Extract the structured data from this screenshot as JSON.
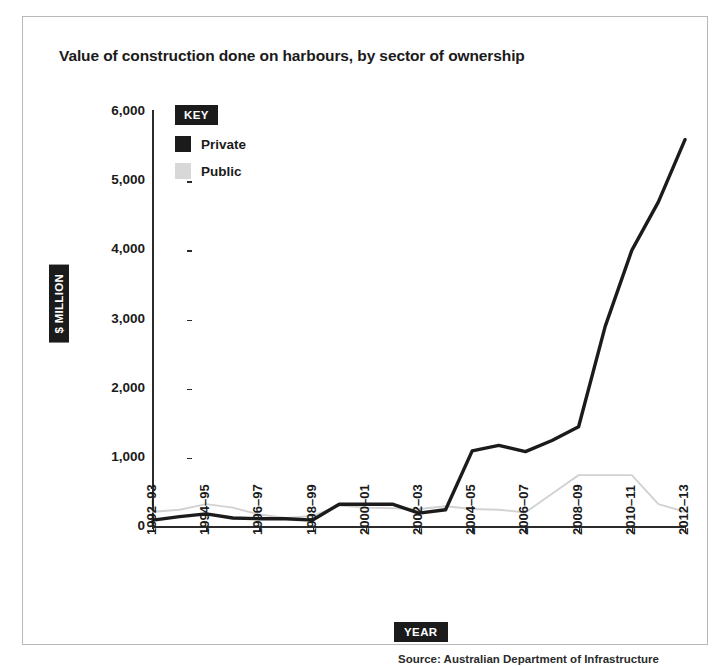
{
  "chart_data": {
    "type": "line",
    "title": "Value of construction done on harbours, by sector of ownership",
    "xlabel": "YEAR",
    "ylabel": "$ MILLION",
    "ylim": [
      0,
      6000
    ],
    "grid": false,
    "legend_position": "top-left",
    "legend_title": "KEY",
    "x": [
      "1992-93",
      "1993-94",
      "1994-95",
      "1995-96",
      "1996-97",
      "1997-98",
      "1998-99",
      "1999-00",
      "2000-01",
      "2001-02",
      "2002-03",
      "2003-04",
      "2004-05",
      "2005-06",
      "2006-07",
      "2007-08",
      "2008-09",
      "2009-10",
      "2010-11",
      "2011-12",
      "2012-13"
    ],
    "xtick_labels": [
      "1992–93",
      "1994–95",
      "1996–97",
      "1998–99",
      "2000–01",
      "2002–03",
      "2004–05",
      "2006–07",
      "2008–09",
      "2010–11",
      "2012–13"
    ],
    "ytick_labels": [
      "0",
      "1,000",
      "2,000",
      "3,000",
      "4,000",
      "5,000",
      "6,000"
    ],
    "ytick_values": [
      0,
      1000,
      2000,
      3000,
      4000,
      5000,
      6000
    ],
    "series": [
      {
        "name": "Private",
        "color": "#1b1b1b",
        "width": 3.4,
        "values": [
          100,
          150,
          190,
          130,
          120,
          120,
          100,
          330,
          330,
          330,
          200,
          250,
          1100,
          1180,
          1090,
          1250,
          1450,
          2900,
          4000,
          4700,
          5600
        ]
      },
      {
        "name": "Public",
        "color": "#d2d2d2",
        "width": 1.9,
        "values": [
          220,
          250,
          330,
          280,
          180,
          130,
          160,
          310,
          280,
          270,
          260,
          300,
          260,
          250,
          210,
          480,
          750,
          750,
          750,
          330,
          220
        ]
      }
    ]
  },
  "legend": {
    "title": "KEY",
    "items": [
      {
        "label": "Private",
        "color": "#1b1b1b"
      },
      {
        "label": "Public",
        "color": "#d8d8d8"
      }
    ]
  },
  "source": {
    "text": "Source: Australian Department of Infrastructure"
  }
}
